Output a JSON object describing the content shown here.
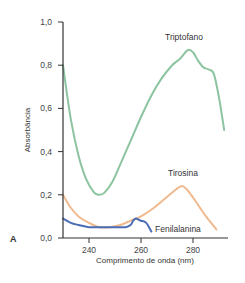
{
  "chart_data": {
    "type": "line",
    "panel_label": "A",
    "title": "",
    "xlabel": "Comprimento de onda (nm)",
    "ylabel": "Absorbância",
    "xlim": [
      230,
      292
    ],
    "ylim": [
      0.0,
      1.0
    ],
    "x_ticks": [
      "240",
      "260",
      "280"
    ],
    "y_ticks": [
      "0,0",
      "0,2",
      "0,4",
      "0,6",
      "0,8",
      "1,0"
    ],
    "grid": false,
    "series": [
      {
        "name": "Triptofano",
        "color": "#8cc4a0",
        "x": [
          230,
          233,
          236,
          239,
          242,
          244,
          246,
          249,
          252,
          256,
          260,
          264,
          268,
          272,
          275,
          278,
          280,
          282,
          284,
          286,
          288,
          290,
          292
        ],
        "y": [
          0.8,
          0.55,
          0.38,
          0.27,
          0.21,
          0.2,
          0.21,
          0.26,
          0.34,
          0.45,
          0.56,
          0.66,
          0.74,
          0.8,
          0.83,
          0.87,
          0.86,
          0.82,
          0.79,
          0.78,
          0.76,
          0.65,
          0.5
        ]
      },
      {
        "name": "Tirosina",
        "color": "#f0b98e",
        "x": [
          230,
          233,
          236,
          240,
          244,
          248,
          252,
          256,
          260,
          265,
          270,
          274,
          276,
          278,
          281,
          285,
          289
        ],
        "y": [
          0.2,
          0.14,
          0.1,
          0.07,
          0.05,
          0.05,
          0.06,
          0.08,
          0.1,
          0.14,
          0.19,
          0.23,
          0.24,
          0.22,
          0.17,
          0.1,
          0.04
        ]
      },
      {
        "name": "Fenilalanina",
        "color": "#4a6db5",
        "x": [
          230,
          233,
          236,
          240,
          245,
          250,
          254,
          256,
          257,
          258,
          259,
          260,
          262,
          264
        ],
        "y": [
          0.09,
          0.07,
          0.06,
          0.05,
          0.05,
          0.05,
          0.05,
          0.06,
          0.08,
          0.09,
          0.085,
          0.08,
          0.07,
          0.03
        ]
      }
    ]
  }
}
